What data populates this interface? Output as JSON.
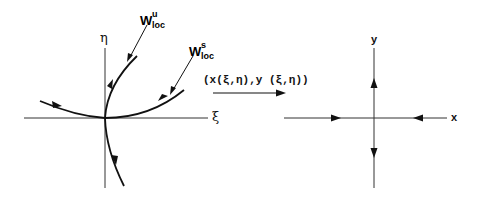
{
  "diagram": {
    "left_panel": {
      "horizontal_axis_label": "ξ",
      "vertical_axis_label": "η",
      "unstable_manifold": {
        "base": "W",
        "superscript": "u",
        "subscript": "loc"
      },
      "stable_manifold": {
        "base": "W",
        "superscript": "s",
        "subscript": "loc"
      }
    },
    "mapping": {
      "label": "(x(ξ,η),y (ξ,η))"
    },
    "right_panel": {
      "horizontal_axis_label": "x",
      "vertical_axis_label": "y"
    },
    "colors": {
      "ink": "#111111",
      "background": "#ffffff"
    }
  }
}
